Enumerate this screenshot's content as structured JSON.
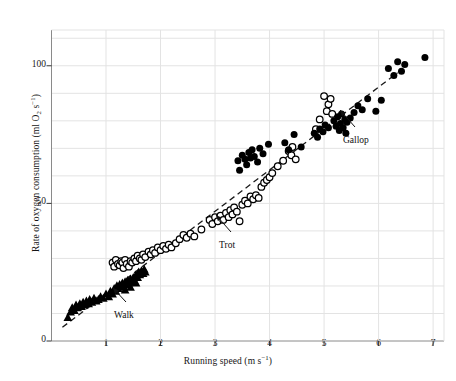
{
  "figure": {
    "type": "scatter-plot",
    "background": "#ffffff"
  },
  "axes": {
    "x": {
      "label_prefix": "Running speed (m s",
      "label_sup": "−1",
      "label_suffix": ")",
      "label_full": "Running speed (m s−1)",
      "ticks": [
        "1",
        "2",
        "3",
        "4",
        "5",
        "6",
        "7"
      ],
      "tick_values": [
        1,
        2,
        3,
        4,
        5,
        6,
        7
      ],
      "min": 0,
      "max": 7.2
    },
    "y": {
      "label_a": "Rate of oxygen consumption (ml O",
      "label_sub": "2",
      "label_b": " s",
      "label_sup": "−1",
      "label_c": ")",
      "label_full": "Rate of oxygen consumption (ml O2 s−1)",
      "ticks": [
        "0",
        "50",
        "100"
      ],
      "tick_values": [
        0,
        50,
        100
      ],
      "min": 0,
      "max": 113
    },
    "grid": "on",
    "grid_color": "#e3e3e3",
    "axis_color": "#8a8a8a"
  },
  "annotations": [
    {
      "name": "walk",
      "text": "Walk",
      "x_px": 126,
      "y_px": 310,
      "tip_x": 113,
      "tip_y": 288
    },
    {
      "name": "trot",
      "text": "Trot",
      "x_px": 231,
      "y_px": 240,
      "tip_x": 216,
      "tip_y": 215
    },
    {
      "name": "gallop",
      "text": "Gallop",
      "x_px": 355,
      "y_px": 135,
      "tip_x": 340,
      "tip_y": 110
    }
  ],
  "trendline": {
    "name": "dashed-regression-line",
    "style": "dashed",
    "color": "#1a1a1a",
    "x0": 0.2,
    "y0": 5.0,
    "x1": 6.35,
    "y1": 97.5
  },
  "chart_data": {
    "type": "scatter",
    "title": "",
    "xlabel": "Running speed (m s−1)",
    "ylabel": "Rate of oxygen consumption (ml O2 s−1)",
    "xlim": [
      0,
      7.2
    ],
    "ylim": [
      0,
      113
    ],
    "grid": true,
    "legend": "none (inline arrow annotations: Walk, Trot, Gallop)",
    "series": [
      {
        "name": "Walk",
        "marker": "filled-triangle",
        "color": "#000000",
        "points": [
          [
            0.3,
            8.5
          ],
          [
            0.35,
            10.5
          ],
          [
            0.38,
            12.0
          ],
          [
            0.42,
            11.0
          ],
          [
            0.45,
            13.0
          ],
          [
            0.48,
            12.0
          ],
          [
            0.52,
            13.5
          ],
          [
            0.55,
            12.5
          ],
          [
            0.58,
            14.0
          ],
          [
            0.6,
            13.0
          ],
          [
            0.64,
            14.5
          ],
          [
            0.68,
            13.5
          ],
          [
            0.7,
            15.0
          ],
          [
            0.74,
            14.0
          ],
          [
            0.78,
            15.5
          ],
          [
            0.82,
            14.5
          ],
          [
            0.86,
            15.0
          ],
          [
            0.9,
            16.0
          ],
          [
            0.95,
            15.5
          ],
          [
            1.0,
            17.0
          ],
          [
            1.05,
            16.0
          ],
          [
            1.08,
            18.0
          ],
          [
            1.12,
            17.0
          ],
          [
            1.15,
            19.0
          ],
          [
            1.18,
            18.0
          ],
          [
            1.2,
            20.0
          ],
          [
            1.22,
            19.0
          ],
          [
            1.25,
            20.5
          ],
          [
            1.28,
            19.5
          ],
          [
            1.3,
            21.0
          ],
          [
            1.32,
            20.0
          ],
          [
            1.35,
            21.5
          ],
          [
            1.38,
            20.5
          ],
          [
            1.4,
            22.0
          ],
          [
            1.42,
            21.0
          ],
          [
            1.45,
            22.5
          ],
          [
            1.48,
            21.5
          ],
          [
            1.5,
            23.0
          ],
          [
            1.52,
            22.0
          ],
          [
            1.55,
            24.0
          ],
          [
            1.58,
            23.0
          ],
          [
            1.6,
            25.0
          ],
          [
            1.62,
            24.0
          ],
          [
            1.65,
            25.5
          ],
          [
            1.68,
            24.5
          ],
          [
            1.7,
            26.0
          ],
          [
            1.72,
            25.0
          ],
          [
            1.35,
            18.5
          ],
          [
            1.45,
            19.5
          ],
          [
            1.55,
            21.0
          ]
        ]
      },
      {
        "name": "Trot",
        "marker": "open-circle",
        "color": "#000000",
        "points": [
          [
            1.12,
            28.5
          ],
          [
            1.15,
            27.0
          ],
          [
            1.18,
            29.5
          ],
          [
            1.22,
            28.0
          ],
          [
            1.25,
            27.5
          ],
          [
            1.28,
            29.0
          ],
          [
            1.3,
            28.5
          ],
          [
            1.32,
            26.5
          ],
          [
            1.35,
            29.5
          ],
          [
            1.38,
            28.0
          ],
          [
            1.42,
            27.0
          ],
          [
            1.45,
            29.0
          ],
          [
            1.48,
            28.5
          ],
          [
            1.52,
            30.0
          ],
          [
            1.55,
            29.0
          ],
          [
            1.58,
            31.0
          ],
          [
            1.62,
            30.0
          ],
          [
            1.65,
            29.5
          ],
          [
            1.68,
            31.5
          ],
          [
            1.72,
            30.5
          ],
          [
            1.78,
            32.5
          ],
          [
            1.82,
            31.5
          ],
          [
            1.86,
            33.0
          ],
          [
            1.9,
            32.0
          ],
          [
            1.95,
            34.0
          ],
          [
            2.0,
            33.0
          ],
          [
            2.05,
            34.5
          ],
          [
            2.1,
            33.5
          ],
          [
            2.15,
            35.0
          ],
          [
            2.2,
            34.0
          ],
          [
            2.28,
            35.5
          ],
          [
            2.35,
            37.0
          ],
          [
            2.42,
            38.5
          ],
          [
            2.48,
            37.5
          ],
          [
            2.55,
            39.0
          ],
          [
            2.62,
            38.0
          ],
          [
            2.75,
            40.5
          ],
          [
            2.9,
            44.0
          ],
          [
            2.95,
            42.5
          ],
          [
            3.0,
            45.0
          ],
          [
            3.05,
            43.5
          ],
          [
            3.1,
            45.5
          ],
          [
            3.15,
            44.0
          ],
          [
            3.2,
            46.5
          ],
          [
            3.25,
            45.0
          ],
          [
            3.28,
            47.5
          ],
          [
            3.32,
            46.0
          ],
          [
            3.35,
            48.5
          ],
          [
            3.4,
            47.0
          ],
          [
            3.45,
            43.5
          ],
          [
            3.5,
            49.5
          ],
          [
            3.55,
            51.0
          ],
          [
            3.6,
            50.0
          ],
          [
            3.65,
            52.5
          ],
          [
            3.7,
            51.5
          ],
          [
            3.75,
            53.0
          ],
          [
            3.8,
            52.0
          ],
          [
            3.85,
            56.0
          ],
          [
            3.9,
            57.5
          ],
          [
            3.95,
            58.5
          ],
          [
            4.0,
            59.5
          ],
          [
            4.05,
            61.0
          ],
          [
            4.15,
            63.5
          ],
          [
            4.25,
            65.5
          ],
          [
            4.35,
            69.0
          ],
          [
            4.4,
            67.5
          ],
          [
            4.42,
            70.5
          ],
          [
            4.48,
            66.0
          ],
          [
            4.85,
            77.0
          ],
          [
            4.92,
            80.5
          ],
          [
            5.0,
            89.0
          ],
          [
            5.05,
            83.5
          ],
          [
            5.08,
            86.0
          ],
          [
            5.12,
            88.0
          ],
          [
            5.15,
            82.5
          ]
        ]
      },
      {
        "name": "Gallop",
        "marker": "filled-circle",
        "color": "#000000",
        "points": [
          [
            3.42,
            65.5
          ],
          [
            3.45,
            62.0
          ],
          [
            3.5,
            67.5
          ],
          [
            3.55,
            66.0
          ],
          [
            3.58,
            64.0
          ],
          [
            3.62,
            68.5
          ],
          [
            3.65,
            66.5
          ],
          [
            3.68,
            69.5
          ],
          [
            3.72,
            67.0
          ],
          [
            3.78,
            65.0
          ],
          [
            3.82,
            70.0
          ],
          [
            3.88,
            68.0
          ],
          [
            3.98,
            71.5
          ],
          [
            4.28,
            72.0
          ],
          [
            4.35,
            69.5
          ],
          [
            4.45,
            75.0
          ],
          [
            4.58,
            70.5
          ],
          [
            4.82,
            75.5
          ],
          [
            4.88,
            74.0
          ],
          [
            4.92,
            77.0
          ],
          [
            4.98,
            76.0
          ],
          [
            5.02,
            78.5
          ],
          [
            5.08,
            77.5
          ],
          [
            5.18,
            80.0
          ],
          [
            5.22,
            78.0
          ],
          [
            5.25,
            81.5
          ],
          [
            5.28,
            76.5
          ],
          [
            5.3,
            79.0
          ],
          [
            5.32,
            82.5
          ],
          [
            5.35,
            77.5
          ],
          [
            5.38,
            80.5
          ],
          [
            5.4,
            75.5
          ],
          [
            5.42,
            79.5
          ],
          [
            5.48,
            81.0
          ],
          [
            5.55,
            83.0
          ],
          [
            5.62,
            85.5
          ],
          [
            5.7,
            84.0
          ],
          [
            5.8,
            88.0
          ],
          [
            5.95,
            83.5
          ],
          [
            6.05,
            87.5
          ],
          [
            6.18,
            99.0
          ],
          [
            6.28,
            96.5
          ],
          [
            6.35,
            101.5
          ],
          [
            6.42,
            98.0
          ],
          [
            6.48,
            100.5
          ],
          [
            6.85,
            103.0
          ]
        ]
      }
    ]
  }
}
